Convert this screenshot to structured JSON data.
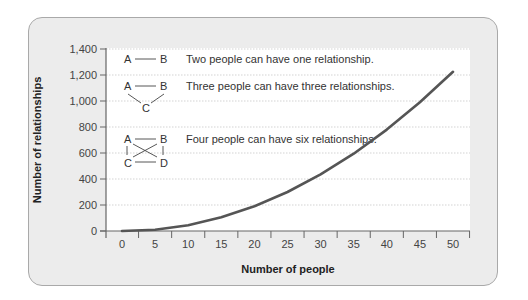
{
  "chart_data": {
    "type": "line",
    "title": "",
    "xlabel": "Number of people",
    "ylabel": "Number of relationships",
    "x": [
      0,
      5,
      10,
      15,
      20,
      25,
      30,
      35,
      40,
      45,
      50
    ],
    "series": [
      {
        "name": "Number of relationships",
        "values": [
          0,
          10,
          45,
          105,
          190,
          300,
          435,
          595,
          780,
          990,
          1225
        ]
      }
    ],
    "xticks": [
      "0",
      "5",
      "10",
      "15",
      "20",
      "25",
      "30",
      "35",
      "40",
      "45",
      "50"
    ],
    "yticks": [
      "0",
      "200",
      "400",
      "600",
      "800",
      "1,000",
      "1,200",
      "1,400"
    ],
    "xlim": [
      0,
      50
    ],
    "ylim": [
      0,
      1400
    ],
    "grid": "horizontal dotted",
    "legend": "none",
    "annotations": [
      {
        "diagram": [
          "A",
          "B"
        ],
        "text": "Two people can have one relationship."
      },
      {
        "diagram": [
          "A",
          "B",
          "C"
        ],
        "text": "Three people can have three relationships."
      },
      {
        "diagram": [
          "A",
          "B",
          "C",
          "D"
        ],
        "text": "Four people can have six relationships."
      }
    ]
  },
  "colors": {
    "panel_bg": "#ececec",
    "panel_border": "#a9a9a9",
    "plot_bg": "#ffffff",
    "line": "#555555",
    "grid": "#c8c8c8",
    "axis": "#666666"
  }
}
